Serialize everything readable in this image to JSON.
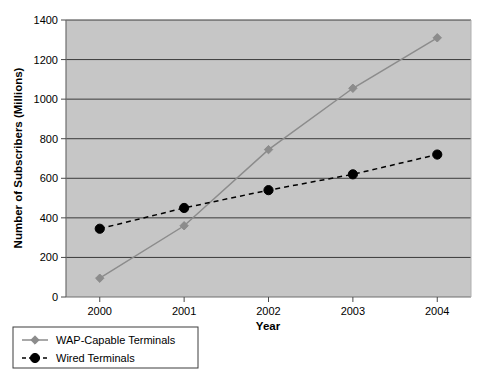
{
  "chart_data": {
    "type": "line",
    "title": "",
    "xlabel": "Year",
    "ylabel": "Number of Subscribers (Millions)",
    "categories": [
      "2000",
      "2001",
      "2002",
      "2003",
      "2004"
    ],
    "x": [
      2000,
      2001,
      2002,
      2003,
      2004
    ],
    "xlim": [
      1999.6,
      2004.4
    ],
    "ylim": [
      0,
      1400
    ],
    "ytick_labels": [
      "0",
      "200",
      "400",
      "600",
      "800",
      "1000",
      "1200",
      "1400"
    ],
    "yticks": [
      0,
      200,
      400,
      600,
      800,
      1000,
      1200,
      1400
    ],
    "xtick_labels": [
      "2000",
      "2001",
      "2002",
      "2003",
      "2004"
    ],
    "grid": "horizontal",
    "legend_position": "below-left",
    "plot_background": "#c6c6c6",
    "figure_background": "#ffffff",
    "series": [
      {
        "name": "WAP-Capable Terminals",
        "values": [
          95,
          360,
          745,
          1055,
          1310
        ],
        "color": "#8c8c8c",
        "marker": "diamond",
        "line_style": "solid"
      },
      {
        "name": "Wired Terminals",
        "values": [
          345,
          450,
          540,
          620,
          720
        ],
        "color": "#000000",
        "marker": "circle",
        "line_style": "dashed"
      }
    ],
    "legend": [
      {
        "label": "WAP-Capable Terminals",
        "color": "#8c8c8c",
        "marker": "diamond",
        "line_style": "solid"
      },
      {
        "label": "Wired Terminals",
        "color": "#000000",
        "marker": "circle",
        "line_style": "dashed"
      }
    ]
  }
}
